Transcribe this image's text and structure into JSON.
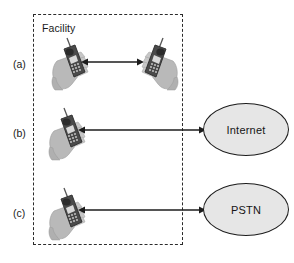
{
  "figure": {
    "background_color": "#ffffff",
    "boundary": {
      "label": "Facility",
      "style": "dashed",
      "color": "#2b2b2b"
    },
    "rows": [
      {
        "id": "a",
        "label": "(a)",
        "description": "Two handsets inside the facility communicating directly",
        "left_endpoint": "mobile-phone-in-hand",
        "right_endpoint": "mobile-phone-in-hand",
        "arrow": "double-headed"
      },
      {
        "id": "b",
        "label": "(b)",
        "description": "Handset inside the facility communicating with the Internet",
        "left_endpoint": "mobile-phone-in-hand",
        "right_endpoint": "Internet",
        "arrow": "double-headed"
      },
      {
        "id": "c",
        "label": "(c)",
        "description": "Handset inside the facility communicating with the PSTN",
        "left_endpoint": "mobile-phone-in-hand",
        "right_endpoint": "PSTN",
        "arrow": "double-headed"
      }
    ],
    "nodes": [
      {
        "id": "internet",
        "label": "Internet",
        "shape": "ellipse",
        "fill": "#e6e6e6",
        "stroke": "#1c1c1c"
      },
      {
        "id": "pstn",
        "label": "PSTN",
        "shape": "ellipse",
        "fill": "#e6e6e6",
        "stroke": "#1c1c1c"
      }
    ],
    "icons": {
      "phone_hand_name": "mobile-phone-in-hand-icon",
      "hand_color": "#b9b9b9",
      "phone_body_color": "#4a4a4a",
      "phone_keypad_color": "#d8d8d8",
      "arrow_color": "#1c1c1c"
    }
  }
}
